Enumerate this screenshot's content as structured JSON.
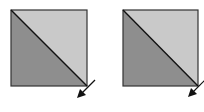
{
  "diagram": {
    "panels": [
      {
        "id": "left",
        "square": {
          "x": 11,
          "y": 10,
          "size": 76
        },
        "upper_triangle_color": "#c9c9c9",
        "lower_triangle_color": "#8e8e8e",
        "diagonal_color": "#111111",
        "arrow": {
          "from": [
            96,
            80
          ],
          "to": [
            78,
            98
          ],
          "direction": "down-left"
        }
      },
      {
        "id": "right",
        "square": {
          "x": 21,
          "y": 10,
          "size": 75
        },
        "upper_triangle_color": "#c9c9c9",
        "lower_triangle_color": "#8e8e8e",
        "diagonal_color": "#111111",
        "arrow": {
          "from": [
            103,
            80
          ],
          "to": [
            87,
            97
          ],
          "direction": "down-left"
        }
      }
    ],
    "border_color": "#333333",
    "arrow_color": "#111111"
  }
}
